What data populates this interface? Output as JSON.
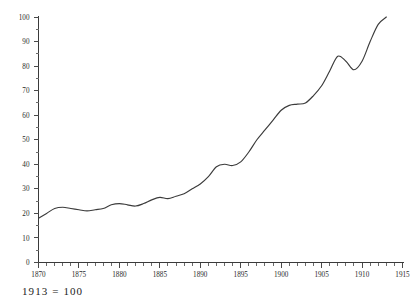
{
  "caption": "1913 = 100",
  "title_partial": "",
  "chart_data": {
    "type": "line",
    "title": "",
    "subtitle": "",
    "xlabel": "",
    "ylabel": "",
    "xlim": [
      1870,
      1915
    ],
    "ylim": [
      0,
      100
    ],
    "grid": false,
    "legend": "none",
    "note": "1913 = 100",
    "y_ticks_major": [
      0,
      10,
      20,
      30,
      40,
      50,
      60,
      70,
      80,
      90,
      100
    ],
    "y_ticks_major_labels": [
      "0",
      "10",
      "20",
      "30",
      "40",
      "50",
      "60",
      "70",
      "80",
      "90",
      "100"
    ],
    "y_tick_minor_step": 5,
    "x_ticks_major": [
      1870,
      1875,
      1880,
      1885,
      1890,
      1895,
      1900,
      1905,
      1910,
      1915
    ],
    "x_ticks_major_labels": [
      "1870",
      "1875",
      "1880",
      "1885",
      "1890",
      "1895",
      "1900",
      "1905",
      "1910",
      "1915"
    ],
    "x_tick_minor_step": 1,
    "series": [
      {
        "name": "Index",
        "color": "#3b3b3b",
        "x": [
          1870,
          1871,
          1872,
          1873,
          1874,
          1875,
          1876,
          1877,
          1878,
          1879,
          1880,
          1881,
          1882,
          1883,
          1884,
          1885,
          1886,
          1887,
          1888,
          1889,
          1890,
          1891,
          1892,
          1893,
          1894,
          1895,
          1896,
          1897,
          1898,
          1899,
          1900,
          1901,
          1902,
          1903,
          1904,
          1905,
          1906,
          1907,
          1908,
          1909,
          1910,
          1911,
          1912,
          1913
        ],
        "values": [
          18,
          20,
          22,
          22.5,
          22,
          21.5,
          21,
          21.5,
          22,
          23.5,
          24,
          23.5,
          23,
          24,
          25.5,
          26.5,
          26,
          27,
          28,
          30,
          32,
          35,
          39,
          40,
          39.5,
          41,
          45,
          50,
          54,
          58,
          62,
          64,
          64.5,
          65,
          68,
          72,
          78,
          84,
          82,
          78.5,
          82,
          90,
          97,
          100
        ]
      }
    ]
  },
  "icons": {
    "axis_origin": "axis-origin-marker"
  },
  "colors": {
    "line": "#3b3b3b",
    "axis": "#3a3a3a",
    "text": "#2a2a2a",
    "background": "#ffffff"
  }
}
